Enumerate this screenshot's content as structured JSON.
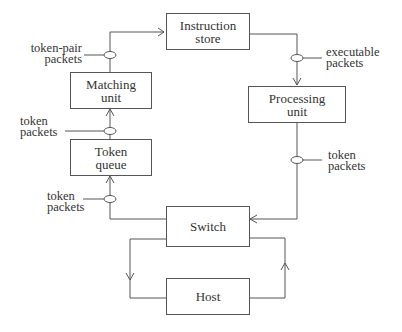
{
  "diagram": {
    "nodes": {
      "instruction_store": {
        "line1": "Instruction",
        "line2": "store"
      },
      "matching_unit": {
        "line1": "Matching",
        "line2": "unit"
      },
      "token_queue": {
        "line1": "Token",
        "line2": "queue"
      },
      "processing_unit": {
        "line1": "Processing",
        "line2": "unit"
      },
      "switch": {
        "line1": "Switch"
      },
      "host": {
        "line1": "Host"
      }
    },
    "labels": {
      "token_pair_packets": {
        "line1": "token-pair",
        "line2": "packets"
      },
      "executable_packets": {
        "line1": "executable",
        "line2": "packets"
      },
      "token_packets_matching": {
        "line1": "token",
        "line2": "packets"
      },
      "token_packets_processing": {
        "line1": "token",
        "line2": "packets"
      },
      "token_packets_queue": {
        "line1": "token",
        "line2": "packets"
      }
    },
    "edges": [
      {
        "from": "Matching unit",
        "to": "Instruction store",
        "label": "token-pair packets"
      },
      {
        "from": "Instruction store",
        "to": "Processing unit",
        "label": "executable packets"
      },
      {
        "from": "Processing unit",
        "to": "Switch",
        "label": "token packets"
      },
      {
        "from": "Switch",
        "to": "Token queue",
        "label": "token packets"
      },
      {
        "from": "Token queue",
        "to": "Matching unit",
        "label": "token packets"
      },
      {
        "from": "Switch",
        "to": "Host",
        "label": ""
      },
      {
        "from": "Host",
        "to": "Switch",
        "label": ""
      }
    ],
    "line_color": "#555555"
  }
}
